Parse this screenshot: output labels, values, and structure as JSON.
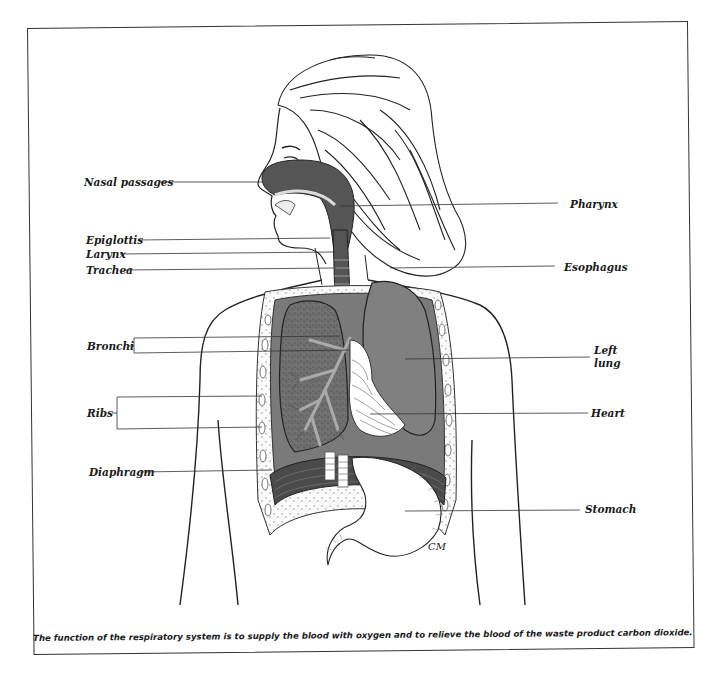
{
  "diagram": {
    "title": "Respiratory system",
    "caption": "The function of the respiratory system is to supply the blood with oxygen and to relieve the blood of the waste product carbon dioxide.",
    "signature": "CM",
    "labels_left": [
      {
        "id": "nasal-passages",
        "text": "Nasal passages"
      },
      {
        "id": "epiglottis",
        "text": "Epiglottis"
      },
      {
        "id": "larynx",
        "text": "Larynx"
      },
      {
        "id": "trachea",
        "text": "Trachea"
      },
      {
        "id": "bronchi",
        "text": "Bronchi"
      },
      {
        "id": "ribs",
        "text": "Ribs"
      },
      {
        "id": "diaphragm",
        "text": "Diaphragm"
      }
    ],
    "labels_right": [
      {
        "id": "pharynx",
        "text": "Pharynx"
      },
      {
        "id": "esophagus",
        "text": "Esophagus"
      },
      {
        "id": "left-lung",
        "text": "Left lung",
        "line1": "Left",
        "line2": "lung"
      },
      {
        "id": "heart",
        "text": "Heart"
      },
      {
        "id": "stomach",
        "text": "Stomach"
      }
    ],
    "colors": {
      "ink": "#1a1a1a",
      "organ_dark": "#555555",
      "organ_mid": "#777777",
      "organ_light": "#9a9a9a",
      "paper": "#ffffff"
    }
  }
}
